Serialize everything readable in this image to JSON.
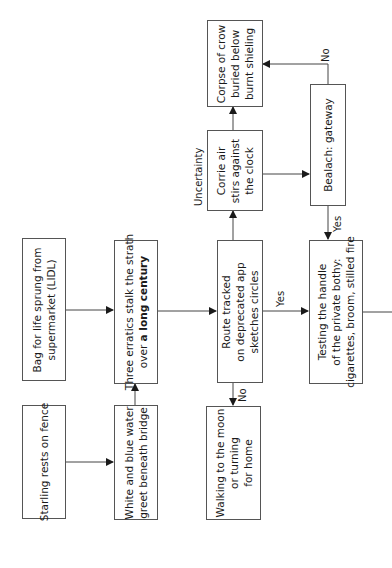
{
  "diagram": {
    "orientation": "rotated-90-ccw",
    "nodes": {
      "starling": {
        "lines": [
          "Starling rests on fence"
        ]
      },
      "bag": {
        "lines": [
          "Bag for life sprung from",
          "supermarket (LIDL)"
        ]
      },
      "white_blue": {
        "lines": [
          "White and blue water",
          "greet beneath bridge"
        ]
      },
      "erratics": {
        "line1": "Three erratics stalk the strath",
        "line2_pre": "over ",
        "line2_bold": "a long century"
      },
      "route": {
        "lines": [
          "Route tracked",
          "on deprecated app",
          "sketches circles"
        ]
      },
      "walking": {
        "lines": [
          "Walking to the moon",
          "or turning",
          "for home"
        ]
      },
      "corrie": {
        "lines": [
          "Corrie air",
          "stirs against",
          "the clock"
        ]
      },
      "corpse": {
        "lines": [
          "Corpse of crow",
          "buried below",
          "burnt shieling"
        ]
      },
      "bealach": {
        "lines": [
          "Bealach: gateway"
        ]
      },
      "testing": {
        "lines": [
          "Testing the handle",
          "of the private bothy:",
          "cigarettes, broom, stilled fire"
        ]
      }
    },
    "edge_labels": {
      "uncertainty": "Uncertainty",
      "route_no": "No",
      "route_yes": "Yes",
      "bealach_no": "No",
      "bealach_yes": "Yes"
    },
    "edges": [
      {
        "from": "starling",
        "to": "white_blue"
      },
      {
        "from": "bag",
        "to": "erratics"
      },
      {
        "from": "white_blue",
        "to": "erratics"
      },
      {
        "from": "erratics",
        "to": "route"
      },
      {
        "from": "route",
        "to": "walking",
        "label": "No"
      },
      {
        "from": "route",
        "to": "corrie",
        "label": "Uncertainty"
      },
      {
        "from": "route",
        "to": "testing",
        "label": "Yes"
      },
      {
        "from": "corrie",
        "to": "corpse"
      },
      {
        "from": "corrie",
        "to": "bealach"
      },
      {
        "from": "bealach",
        "to": "corpse",
        "label": "No"
      },
      {
        "from": "bealach",
        "to": "testing",
        "label": "Yes"
      },
      {
        "from": "testing",
        "to": "offscreen-right"
      }
    ],
    "colors": {
      "stroke": "#555555",
      "text": "#1a1a1a",
      "background": "#ffffff"
    }
  }
}
